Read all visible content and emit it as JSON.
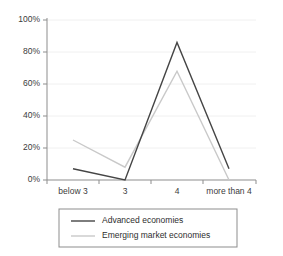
{
  "chart_data": {
    "type": "line",
    "title": "",
    "subtitle": "",
    "xlabel": "",
    "ylabel": "",
    "categories": [
      "below 3",
      "3",
      "4",
      "more than 4"
    ],
    "ylim": [
      0,
      100
    ],
    "ytick_labels": [
      "0%",
      "20%",
      "40%",
      "60%",
      "80%",
      "100%"
    ],
    "ytick_values": [
      0,
      20,
      40,
      60,
      80,
      100
    ],
    "grid": true,
    "legend_position": "bottom",
    "series": [
      {
        "name": "Advanced economies",
        "color": "#454545",
        "values": [
          7,
          0,
          86,
          7
        ]
      },
      {
        "name": "Emerging market economies",
        "color": "#c9c9c9",
        "values": [
          25,
          8,
          68,
          0
        ]
      }
    ]
  },
  "legend": {
    "items": [
      {
        "label": "Advanced economies",
        "color": "#454545"
      },
      {
        "label": "Emerging market economies",
        "color": "#c9c9c9"
      }
    ]
  },
  "colors": {
    "advanced_economies": "#454545",
    "emerging_market_economies": "#c9c9c9",
    "axis": "#8d8d8d",
    "grid": "#ececec",
    "text": "#3b3b3b",
    "background": "#ffffff"
  }
}
